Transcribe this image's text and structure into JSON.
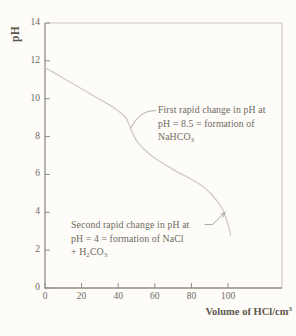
{
  "figure": {
    "background": "#fdfcf9",
    "axis_color": "#918d83",
    "frame_color": "#c9c5bc",
    "curve_color": "#cfccc3",
    "leader_color": "#a5a196",
    "text_color": "#6e695d",
    "bold_label_color": "#5c564a"
  },
  "chart_data": {
    "type": "line",
    "title": "",
    "xlabel": "Volume of HCl/cm^3^",
    "ylabel": "pH",
    "xlim": [
      0,
      129.5
    ],
    "ylim": [
      0,
      14
    ],
    "x_ticks": [
      0,
      20,
      40,
      60,
      80,
      100
    ],
    "y_ticks": [
      0,
      2,
      4,
      6,
      8,
      10,
      12,
      14
    ],
    "grid": false,
    "legend": "none",
    "series": [
      {
        "name": "carbonate-titration-curve",
        "points": [
          [
            0,
            11.65
          ],
          [
            8,
            11.2
          ],
          [
            16,
            10.75
          ],
          [
            24,
            10.3
          ],
          [
            32,
            9.85
          ],
          [
            38,
            9.5
          ],
          [
            42,
            9.2
          ],
          [
            44.5,
            8.95
          ],
          [
            46.5,
            8.5
          ],
          [
            48.5,
            8.05
          ],
          [
            51,
            7.65
          ],
          [
            55,
            7.25
          ],
          [
            60,
            6.85
          ],
          [
            66,
            6.5
          ],
          [
            72,
            6.15
          ],
          [
            79,
            5.8
          ],
          [
            85,
            5.45
          ],
          [
            90,
            5.05
          ],
          [
            94,
            4.6
          ],
          [
            96.5,
            4.25
          ],
          [
            98.5,
            3.8
          ],
          [
            100,
            3.35
          ],
          [
            101.5,
            2.8
          ]
        ]
      }
    ],
    "annotations": [
      {
        "lines": [
          "First rapid change in pH at",
          "pH = 8.5 = formation of",
          "NaHCO_3_"
        ],
        "anchor_x": 46.8,
        "anchor_y": 8.45
      },
      {
        "lines": [
          "Second rapid change in pH at",
          "pH = 4 = formation of NaCl",
          "+ H_2_CO_3_"
        ],
        "anchor_x": 99,
        "anchor_y": 4.05
      }
    ]
  }
}
